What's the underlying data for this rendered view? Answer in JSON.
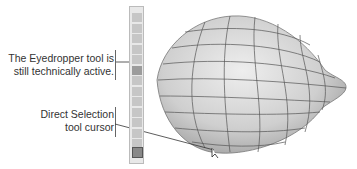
{
  "callouts": [
    {
      "line1": "The Eyedropper tool is",
      "line2": "still technically active."
    },
    {
      "line1": "Direct Selection",
      "line2": "tool cursor"
    }
  ],
  "toolbar": {
    "tools": [
      "selection-icon",
      "direct-selection-icon",
      "pen-icon",
      "type-icon",
      "gradient-icon",
      "eyedropper-icon",
      "brush-icon",
      "rotate-icon",
      "graph-icon",
      "artboard-icon",
      "pencil-icon",
      "blob-icon",
      "zoom-icon"
    ],
    "active_tool": "eyedropper-icon"
  },
  "colors": {
    "text": "#333333",
    "mesh": "#555555",
    "shape_fill": "#d4d4d4"
  }
}
